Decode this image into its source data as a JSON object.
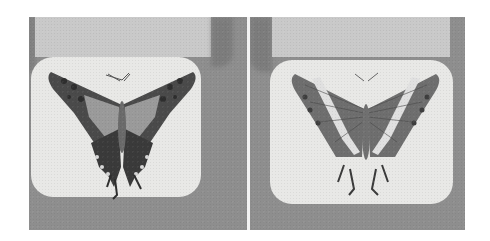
{
  "image": {
    "description": "Grayscale photograph of two mounted butterfly specimens side by side, each on a rounded light card over a grey background with a pale label tab above",
    "panels": [
      {
        "position": "left",
        "subject": "butterfly-upperside",
        "pattern": "dark wings with pale median band and scalloped hindwing margin with tails"
      },
      {
        "position": "right",
        "subject": "butterfly-underside",
        "pattern": "veined wings with pale diagonal white band and tailed hindwings"
      }
    ],
    "colors": {
      "background": "#8e8e8e",
      "card": "#e8e8e6",
      "label_tab": "#c9c9c9",
      "wing_dark": "#3c3c3c",
      "wing_mid": "#7a7a7a",
      "page": "#ffffff"
    }
  }
}
